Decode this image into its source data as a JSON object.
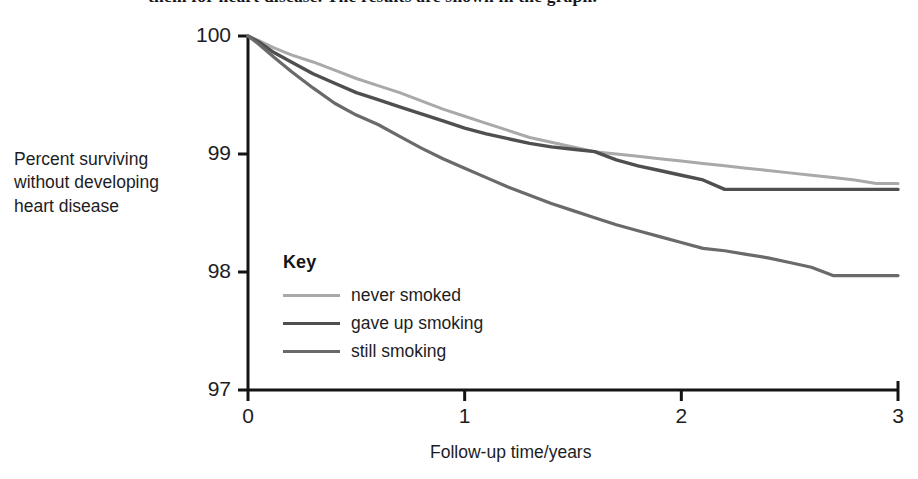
{
  "clipped_body_text": "them for heart disease. The results are shown in the graph.",
  "axis_titles": {
    "y_line1": "Percent surviving",
    "y_line2": "without developing",
    "y_line3": "heart disease",
    "x": "Follow-up time/years"
  },
  "legend": {
    "title": "Key",
    "entries": [
      {
        "label": "never smoked",
        "color": "#a9a9a9",
        "width": 3.0
      },
      {
        "label": "gave up smoking",
        "color": "#4f4f4f",
        "width": 3.4
      },
      {
        "label": "still smoking",
        "color": "#6a6a6a",
        "width": 3.2
      }
    ]
  },
  "chart_data": {
    "type": "line",
    "title": "",
    "xlabel": "Follow-up time/years",
    "ylabel": "Percent surviving without developing heart disease",
    "xlim": [
      0,
      3
    ],
    "ylim": [
      97,
      100
    ],
    "xticks": [
      0,
      1,
      2,
      3
    ],
    "xtick_labels": [
      "0",
      "1",
      "2",
      "3"
    ],
    "yticks": [
      97,
      98,
      99,
      100
    ],
    "ytick_labels": [
      "97",
      "98",
      "99",
      "100"
    ],
    "grid": false,
    "legend_position": "inside-lower-left",
    "legend_title": "Key",
    "annotations": [
      "all three curves start at 100% at time 0",
      "never smoked and gave up smoking curves cross at about 1.6 years near 99.0%",
      "gave up smoking curve is flat at about 98.70% from about 2.2 years onward",
      "still smoking curve is flat at about 97.97% from about 2.7 years onward"
    ],
    "series": [
      {
        "name": "never smoked",
        "color": "#a9a9a9",
        "x": [
          0,
          0.05,
          0.12,
          0.2,
          0.3,
          0.4,
          0.5,
          0.6,
          0.7,
          0.8,
          0.9,
          1.0,
          1.1,
          1.2,
          1.3,
          1.4,
          1.5,
          1.6,
          1.7,
          1.8,
          1.9,
          2.0,
          2.1,
          2.2,
          2.3,
          2.4,
          2.5,
          2.6,
          2.7,
          2.8,
          2.9,
          3.0
        ],
        "values": [
          100,
          99.96,
          99.9,
          99.84,
          99.78,
          99.71,
          99.64,
          99.58,
          99.52,
          99.45,
          99.38,
          99.32,
          99.26,
          99.2,
          99.14,
          99.1,
          99.06,
          99.02,
          99.0,
          98.98,
          98.96,
          98.94,
          98.92,
          98.9,
          98.88,
          98.86,
          98.84,
          98.82,
          98.8,
          98.78,
          98.75,
          98.75
        ]
      },
      {
        "name": "gave up smoking",
        "color": "#4f4f4f",
        "x": [
          0,
          0.05,
          0.12,
          0.2,
          0.3,
          0.4,
          0.5,
          0.6,
          0.7,
          0.8,
          0.9,
          1.0,
          1.1,
          1.2,
          1.3,
          1.4,
          1.5,
          1.6,
          1.7,
          1.8,
          1.9,
          2.0,
          2.1,
          2.2,
          2.3,
          2.4,
          2.5,
          2.6,
          2.7,
          2.8,
          2.9,
          3.0
        ],
        "values": [
          100,
          99.95,
          99.86,
          99.78,
          99.68,
          99.6,
          99.52,
          99.46,
          99.4,
          99.34,
          99.28,
          99.22,
          99.17,
          99.13,
          99.09,
          99.06,
          99.04,
          99.02,
          98.95,
          98.9,
          98.86,
          98.82,
          98.78,
          98.7,
          98.7,
          98.7,
          98.7,
          98.7,
          98.7,
          98.7,
          98.7,
          98.7
        ]
      },
      {
        "name": "still smoking",
        "color": "#6a6a6a",
        "x": [
          0,
          0.05,
          0.12,
          0.2,
          0.3,
          0.4,
          0.5,
          0.6,
          0.7,
          0.8,
          0.9,
          1.0,
          1.1,
          1.2,
          1.3,
          1.4,
          1.5,
          1.6,
          1.7,
          1.8,
          1.9,
          2.0,
          2.1,
          2.2,
          2.3,
          2.4,
          2.5,
          2.6,
          2.7,
          2.8,
          2.9,
          3.0
        ],
        "values": [
          100,
          99.93,
          99.82,
          99.7,
          99.56,
          99.43,
          99.33,
          99.25,
          99.15,
          99.05,
          98.96,
          98.88,
          98.8,
          98.72,
          98.65,
          98.58,
          98.52,
          98.46,
          98.4,
          98.35,
          98.3,
          98.25,
          98.2,
          98.18,
          98.15,
          98.12,
          98.08,
          98.04,
          97.97,
          97.97,
          97.97,
          97.97
        ]
      }
    ]
  },
  "plot_geometry": {
    "x0_px": 248,
    "x3_px": 898,
    "y100_px": 36,
    "y97_px": 390
  }
}
